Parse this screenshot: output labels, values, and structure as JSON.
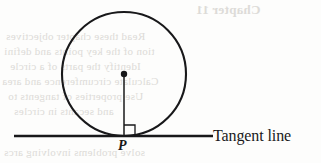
{
  "figure": {
    "type": "geometry-diagram",
    "labels": {
      "tangent_point": "P",
      "tangent_line": "Tangent line"
    },
    "marks": {
      "right_angle": "right-angle-marker",
      "center_dot": "center-point-dot"
    },
    "geometry": {
      "circle": {
        "cx": 124,
        "cy": 74,
        "r": 62
      },
      "center_dot_r": 3.2,
      "radius_segment": {
        "x1": 124,
        "y1": 74,
        "x2": 124,
        "y2": 136
      },
      "tangent_line": {
        "x1": 14,
        "y1": 136,
        "x2": 213,
        "y2": 136
      },
      "right_angle_square": {
        "x": 124,
        "y": 125,
        "size": 11
      }
    },
    "colors": {
      "ink": "#18181a",
      "paper": "#fdfdfc",
      "bleed_text": "#d8d6d2"
    },
    "strokes": {
      "circle": 2.1,
      "radius": 1.5,
      "tangent": 2.6,
      "right_angle": 1.3
    }
  },
  "background_showthrough": {
    "note": "faint mirrored text bleeding through from the reverse side of the page",
    "lines": [
      {
        "text": "Chapter 11",
        "x": 196,
        "y": 2,
        "size": 13,
        "bold": true
      },
      {
        "text": "Read these chapter objectives",
        "x": 6,
        "y": 30,
        "size": 11,
        "bold": false
      },
      {
        "text": "tion of the key points and defini",
        "x": 4,
        "y": 45,
        "size": 11,
        "bold": false
      },
      {
        "text": "Identify the parts of a circle",
        "x": 10,
        "y": 60,
        "size": 11,
        "bold": false
      },
      {
        "text": "Calculate circumference and area",
        "x": 2,
        "y": 75,
        "size": 11,
        "bold": false
      },
      {
        "text": "Use properties of tangents to",
        "x": 8,
        "y": 90,
        "size": 11,
        "bold": false
      },
      {
        "text": "and secants in circles",
        "x": 14,
        "y": 105,
        "size": 11,
        "bold": false
      },
      {
        "text": "solve problems involving arcs",
        "x": 4,
        "y": 146,
        "size": 11,
        "bold": false
      }
    ]
  }
}
